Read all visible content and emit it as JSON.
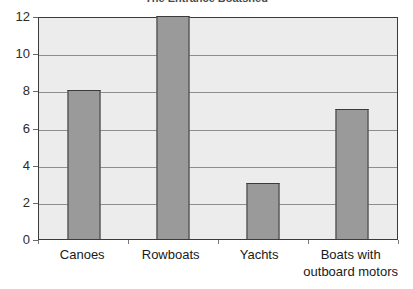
{
  "chart_data": {
    "type": "bar",
    "title": "The Entrance Boatshed",
    "xlabel": "",
    "ylabel": "",
    "categories": [
      "Canoes",
      "Rowboats",
      "Yachts",
      "Boats with outboard motors"
    ],
    "category_lines": [
      [
        "Canoes"
      ],
      [
        "Rowboats"
      ],
      [
        "Yachts"
      ],
      [
        "Boats with",
        "outboard motors"
      ]
    ],
    "values": [
      8,
      12,
      3,
      7
    ],
    "ylim": [
      0,
      12
    ],
    "ytick_step": 2,
    "yticks": [
      12,
      10,
      8,
      6,
      4,
      2,
      0
    ],
    "grid": true,
    "legend": false,
    "colors": {
      "bar_fill": "#9a9a9a",
      "bar_outline": "#3b3b3b",
      "plot_background": "#ececec",
      "gridline": "#8e8e8e",
      "page_background": "#ffffff",
      "text": "#1a1a1a"
    }
  }
}
